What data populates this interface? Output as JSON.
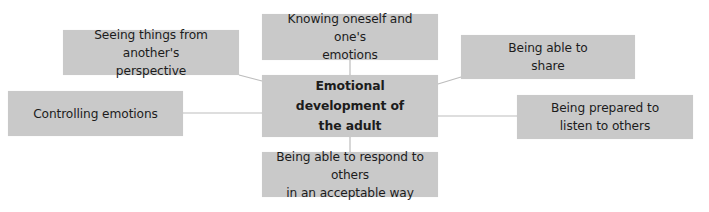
{
  "diagram": {
    "center": {
      "label": "Emotional development of\nthe adult"
    },
    "nodes": {
      "top": {
        "label": "Knowing oneself and one's\nemotions"
      },
      "top_left": {
        "label": "Seeing things from another's\nperspective"
      },
      "left": {
        "label": "Controlling emotions"
      },
      "top_right": {
        "label": "Being able to\nshare"
      },
      "right": {
        "label": "Being prepared to\nlisten to others"
      },
      "bottom": {
        "label": "Being able to respond to others\nin an acceptable way"
      }
    },
    "colors": {
      "box_fill": "#c9c9c9",
      "connector": "#bdbdbd",
      "text": "#1c1c1c",
      "background": "#ffffff"
    }
  }
}
